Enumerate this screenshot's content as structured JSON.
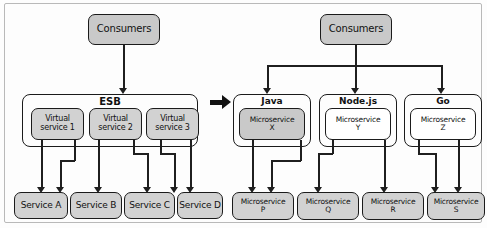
{
  "diagram": {
    "transition_arrow": "right-arrow",
    "colors": {
      "node_fill_gray": "#c9c9c9",
      "node_fill_white": "#ffffff",
      "stroke": "#1b1b1b",
      "frame_border": "#b9b9b9",
      "background": "#fdfdfd"
    }
  },
  "left_panel": {
    "consumers": {
      "label": "Consumers"
    },
    "esb": {
      "label": "ESB",
      "virtual_services": [
        {
          "label": "Virtual\nservice 1"
        },
        {
          "label": "Virtual\nservice 2"
        },
        {
          "label": "Virtual\nservice 3"
        }
      ]
    },
    "services": [
      {
        "label": "Service A"
      },
      {
        "label": "Service B"
      },
      {
        "label": "Service C"
      },
      {
        "label": "Service D"
      }
    ]
  },
  "right_panel": {
    "consumers": {
      "label": "Consumers"
    },
    "runtimes": [
      {
        "label": "Java",
        "microservice": "Microservice\nX",
        "highlighted": true
      },
      {
        "label": "Node.js",
        "microservice": "Microservice\nY",
        "highlighted": false
      },
      {
        "label": "Go",
        "microservice": "Microservice\nZ",
        "highlighted": false
      }
    ],
    "microservices": [
      {
        "label": "Microservice\nP"
      },
      {
        "label": "Microservice\nQ"
      },
      {
        "label": "Microservice\nR"
      },
      {
        "label": "Microservice\nS"
      }
    ]
  }
}
